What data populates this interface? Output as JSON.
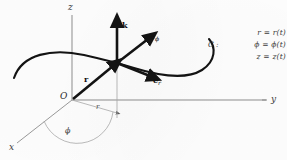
{
  "figure": {
    "axes": {
      "x_label": "x",
      "y_label": "y",
      "z_label": "z"
    },
    "origin_label": "O",
    "vectors": [
      {
        "name": "position-vector",
        "label": "r"
      },
      {
        "name": "k-unit-vector",
        "label": "k"
      },
      {
        "name": "e-phi-unit-vector",
        "label": "e",
        "sub": "ϕ"
      },
      {
        "name": "e-r-unit-vector",
        "label": "e",
        "sub": "r"
      }
    ],
    "angle_label": "ϕ",
    "radial_label": "r",
    "curve_label": "C",
    "equations": {
      "curve_name": "C :",
      "lines": [
        "r = r(t)",
        "ϕ = ϕ(t)",
        "z = z(t)"
      ]
    },
    "colors": {
      "ink": "#1a1a1a",
      "axis": "#7d7d7d",
      "construction": "#a8a8a8",
      "background": "#fefefe",
      "label": "#3b3b3b"
    }
  }
}
